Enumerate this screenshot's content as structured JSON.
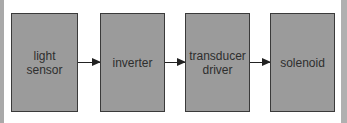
{
  "diagram": {
    "type": "block-flow",
    "blocks": [
      {
        "id": "b1",
        "label": "light\nsensor"
      },
      {
        "id": "b2",
        "label": "inverter"
      },
      {
        "id": "b3",
        "label": "transducer\ndriver"
      },
      {
        "id": "b4",
        "label": "solenoid"
      }
    ],
    "edges": [
      {
        "from": "b1",
        "to": "b2"
      },
      {
        "from": "b2",
        "to": "b3"
      },
      {
        "from": "b3",
        "to": "b4"
      }
    ],
    "colors": {
      "block_fill": "#9b9b9b",
      "block_border": "#3a3a3a",
      "arrow": "#222222",
      "background": "#ffffff"
    }
  }
}
